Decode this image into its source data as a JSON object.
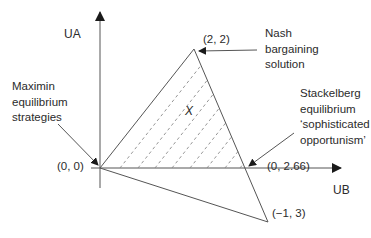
{
  "axes": {
    "y_label": "UA",
    "x_label": "UB"
  },
  "points": {
    "origin": "(0, 0)",
    "nash": "(2, 2)",
    "stackelberg": "(0, 2.66)",
    "bottom": "(−1, 3)"
  },
  "annotations": {
    "maximin": [
      "Maximin",
      "equilibrium",
      "strategies"
    ],
    "nash": [
      "Nash",
      "bargaining",
      "solution"
    ],
    "stackelberg": [
      "Stackelberg",
      "equilibrium",
      "‘sophisticated",
      "opportunism’"
    ]
  },
  "region_mark": "X",
  "colors": {
    "line": "#555555",
    "hatch": "#8a8a8a",
    "text": "#2b2b2b"
  }
}
